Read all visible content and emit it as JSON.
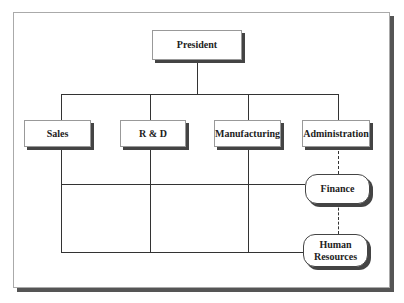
{
  "chart": {
    "top": {
      "label": "President"
    },
    "departments": [
      {
        "label": "Sales"
      },
      {
        "label": "R & D"
      },
      {
        "label": "Manufacturing"
      },
      {
        "label": "Administration"
      }
    ],
    "staff_units": [
      {
        "label": "Finance",
        "reports_to": "Administration",
        "relation": "dashed"
      },
      {
        "label": "Human Resources",
        "reports_to": "Administration",
        "relation": "dashed"
      }
    ]
  }
}
